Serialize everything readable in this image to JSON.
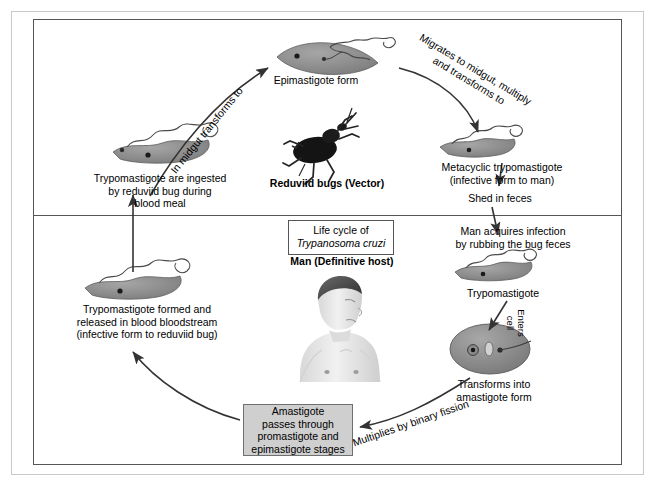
{
  "diagram": {
    "title_line1": "Life cycle of",
    "title_species": "Trypanosoma cruzi",
    "vector_caption": "Reduviid bugs  (Vector)",
    "host_caption": "Man (Definitive host)"
  },
  "stages": {
    "epimastigote": "Epimastigote form",
    "metacyclic": "Metacyclic trypomastigote\n(infective form to man)",
    "trypomastigote_right": "Trypomastigote",
    "amastigote_transform": "Transforms into\namastigote form",
    "amastigote_box": "Amastigote\npasses through\npromastigote and\nepimastigote stages",
    "trypomastigote_left": "Trypomastigote formed and\nreleased in blood bloodstream\n(infective form to reduviid bug)",
    "ingested": "Trypomastigote are ingested\nby reduviid bug during\nblood meal"
  },
  "arrows": {
    "in_midgut": "In midgut transforms to",
    "migrates": "Migrates to midgut, multiply\nand transforms to",
    "shed": "Shed in feces",
    "man_acquires": "Man acquires infection\nby rubbing the bug feces",
    "enters_cell": "Enters\ncell",
    "binary_fission": "Multiplies by binary fission"
  },
  "colors": {
    "parasite_body": "#8c8c8c",
    "parasite_dark": "#6b6b6b",
    "box_fill": "#cfcfcf",
    "line": "#333333",
    "frame": "#555555",
    "bug": "#111111"
  }
}
